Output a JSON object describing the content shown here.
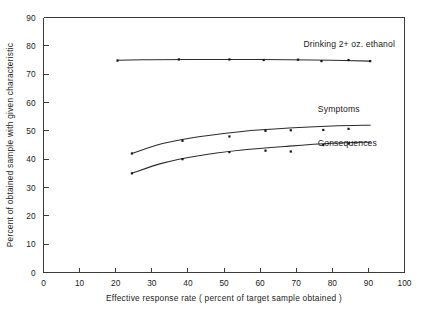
{
  "chart_data": {
    "type": "line",
    "title": "",
    "xlabel": "Effective response rate ( percent of target sample obtained )",
    "ylabel": "Percent of obtained sample with given characteristic",
    "xlim": [
      0,
      100
    ],
    "ylim": [
      0,
      90
    ],
    "xticks": [
      0,
      10,
      20,
      30,
      40,
      50,
      60,
      70,
      80,
      90,
      100
    ],
    "yticks": [
      0,
      10,
      20,
      30,
      40,
      50,
      60,
      70,
      80,
      90
    ],
    "xtick_labels": [
      "0",
      "10",
      "20",
      "30",
      "40",
      "50",
      "60",
      "70",
      "80",
      "90",
      "100"
    ],
    "ytick_labels": [
      "0",
      "10",
      "20",
      "30",
      "40",
      "50",
      "60",
      "70",
      "80",
      "90"
    ],
    "grid": false,
    "legend_position": "inline-right",
    "series": [
      {
        "name": "Drinking 2+ oz. ethanol",
        "label_x": 72,
        "label_y": 79.5,
        "points": [
          {
            "x": 20.5,
            "y": 74.8
          },
          {
            "x": 37.5,
            "y": 75.2
          },
          {
            "x": 51.5,
            "y": 75.2
          },
          {
            "x": 61.0,
            "y": 75.0
          },
          {
            "x": 70.5,
            "y": 75.1
          },
          {
            "x": 77.0,
            "y": 74.6
          },
          {
            "x": 84.5,
            "y": 75.0
          },
          {
            "x": 90.5,
            "y": 74.6
          }
        ],
        "curve": [
          {
            "x": 20.5,
            "y": 74.9
          },
          {
            "x": 30.0,
            "y": 75.1
          },
          {
            "x": 42.0,
            "y": 75.2
          },
          {
            "x": 55.0,
            "y": 75.2
          },
          {
            "x": 68.0,
            "y": 75.1
          },
          {
            "x": 80.0,
            "y": 74.9
          },
          {
            "x": 90.5,
            "y": 74.6
          }
        ]
      },
      {
        "name": "Symptoms",
        "label_x": 76,
        "label_y": 56.5,
        "points": [
          {
            "x": 24.5,
            "y": 42.0
          },
          {
            "x": 38.5,
            "y": 46.5
          },
          {
            "x": 51.5,
            "y": 48.0
          },
          {
            "x": 61.5,
            "y": 50.0
          },
          {
            "x": 68.5,
            "y": 50.2
          },
          {
            "x": 77.5,
            "y": 50.3
          },
          {
            "x": 84.5,
            "y": 50.7
          }
        ],
        "curve": [
          {
            "x": 24.5,
            "y": 42.0
          },
          {
            "x": 33.0,
            "y": 45.5
          },
          {
            "x": 43.0,
            "y": 47.9
          },
          {
            "x": 55.0,
            "y": 49.8
          },
          {
            "x": 68.0,
            "y": 51.0
          },
          {
            "x": 80.0,
            "y": 51.7
          },
          {
            "x": 90.5,
            "y": 52.0
          }
        ]
      },
      {
        "name": "Consequences",
        "label_x": 76,
        "label_y": 44.5,
        "points": [
          {
            "x": 24.5,
            "y": 35.0
          },
          {
            "x": 38.5,
            "y": 40.0
          },
          {
            "x": 51.5,
            "y": 42.5
          },
          {
            "x": 61.5,
            "y": 43.0
          },
          {
            "x": 68.5,
            "y": 42.7
          },
          {
            "x": 77.5,
            "y": 45.0
          },
          {
            "x": 84.5,
            "y": 45.5
          }
        ],
        "curve": [
          {
            "x": 24.5,
            "y": 35.0
          },
          {
            "x": 33.0,
            "y": 38.6
          },
          {
            "x": 43.0,
            "y": 41.2
          },
          {
            "x": 55.0,
            "y": 43.2
          },
          {
            "x": 68.0,
            "y": 44.6
          },
          {
            "x": 80.0,
            "y": 45.6
          },
          {
            "x": 90.5,
            "y": 46.0
          }
        ]
      }
    ]
  },
  "colors": {
    "axis": "#3a3a3a",
    "curve": "#2b2b2b",
    "point": "#141414",
    "background": "#ffffff"
  }
}
